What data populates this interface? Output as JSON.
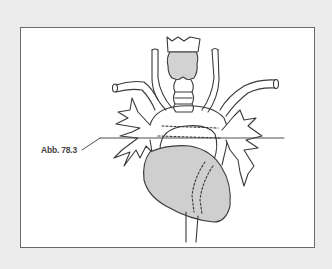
{
  "figure": {
    "label": "Abb. 78.3",
    "colors": {
      "background": "#ececec",
      "frame_fill": "#ffffff",
      "frame_border": "#6a6a6a",
      "outline": "#3a3a3a",
      "shaded_fill": "#cfcfcf"
    }
  }
}
